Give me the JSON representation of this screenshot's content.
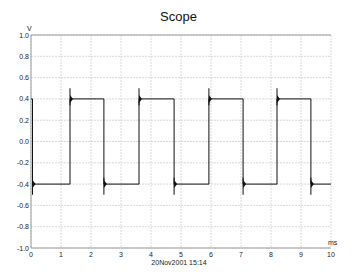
{
  "chart_data": {
    "type": "line",
    "title": "Scope",
    "xlabel": "ms",
    "ylabel": "V",
    "xlim": [
      0,
      10
    ],
    "ylim": [
      -1.0,
      1.0
    ],
    "grid": true,
    "legend": null,
    "x_ticks": [
      "0",
      "1",
      "2",
      "3",
      "4",
      "5",
      "6",
      "7",
      "8",
      "9",
      "10"
    ],
    "y_ticks": [
      "1.0",
      "0.8",
      "0.6",
      "0.4",
      "0.2",
      "0.0",
      "-0.2",
      "-0.4",
      "-0.6",
      "-0.8",
      "-1.0"
    ],
    "series": [
      {
        "name": "Channel",
        "description": "Square wave, ±0.4 V, period ≈2.3 ms, with ringing overshoot spikes at each transition",
        "x": [
          0.0,
          0.05,
          0.05,
          1.3,
          1.3,
          2.43,
          2.43,
          3.6,
          3.6,
          4.77,
          4.77,
          5.93,
          5.93,
          7.07,
          7.07,
          8.2,
          8.2,
          9.33,
          9.33,
          10.0
        ],
        "y": [
          0.4,
          0.4,
          -0.4,
          -0.4,
          0.4,
          0.4,
          -0.4,
          -0.4,
          0.4,
          0.4,
          -0.4,
          -0.4,
          0.4,
          0.4,
          -0.4,
          -0.4,
          0.4,
          0.4,
          -0.4,
          -0.4
        ],
        "high_level": 0.4,
        "low_level": -0.4,
        "rising_edges_ms": [
          1.3,
          3.6,
          5.93,
          8.2
        ],
        "falling_edges_ms": [
          0.05,
          2.43,
          4.77,
          7.07,
          9.33
        ],
        "overshoot_peak": 0.5,
        "undershoot_peak": -0.5
      }
    ],
    "annotations": [
      "20Nov2001  15:14"
    ]
  },
  "header": {
    "title": "Scope"
  },
  "footer": {
    "timestamp": "20Nov2001  15:14"
  },
  "axes": {
    "x_unit": "ms",
    "y_unit": "V"
  }
}
